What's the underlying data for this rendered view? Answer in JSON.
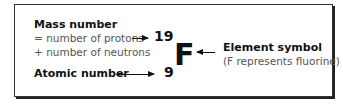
{
  "diagram": {
    "mass_number": {
      "title": "Mass number",
      "line1": "= number of protons",
      "line2": "+ number of neutrons",
      "value": "19"
    },
    "atomic_number": {
      "title": "Atomic number",
      "value": "9"
    },
    "element": {
      "symbol": "F",
      "label": "Element symbol",
      "note": "(F represents fluorine)"
    }
  }
}
